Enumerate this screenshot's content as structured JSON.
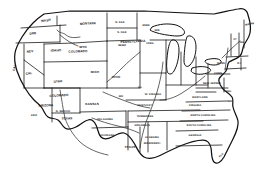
{
  "figure": {
    "name": "united-states-outline-map",
    "background_color": "#ffffff",
    "ink_color": "#111111",
    "width": 267,
    "height": 175
  },
  "states": [
    {
      "label": "WASH",
      "x": 46,
      "y": 21,
      "size": "sz-s",
      "rotate": -8
    },
    {
      "label": "ORE",
      "x": 33,
      "y": 34,
      "size": "sz-s",
      "rotate": -6
    },
    {
      "label": "MONTANA",
      "x": 88,
      "y": 24,
      "size": "sz-s",
      "rotate": -3
    },
    {
      "label": "N. DAK",
      "x": 120,
      "y": 23,
      "size": "sz-xs",
      "rotate": 0
    },
    {
      "label": "S. DAK",
      "x": 122,
      "y": 33,
      "size": "sz-xs",
      "rotate": 0
    },
    {
      "label": "MINN",
      "x": 146,
      "y": 26,
      "size": "sz-xs",
      "rotate": 0
    },
    {
      "label": "NEV",
      "x": 30,
      "y": 52,
      "size": "sz-s",
      "rotate": -4
    },
    {
      "label": "IDAHO",
      "x": 56,
      "y": 51,
      "size": "sz-s",
      "rotate": -2
    },
    {
      "label": "WYO",
      "x": 83,
      "y": 48,
      "size": "sz-s",
      "rotate": 0
    },
    {
      "label": "NEBR",
      "x": 122,
      "y": 46,
      "size": "sz-xs",
      "rotate": 0
    },
    {
      "label": "IOWA",
      "x": 150,
      "y": 44,
      "size": "sz-xs",
      "rotate": 0
    },
    {
      "label": "WIS",
      "x": 157,
      "y": 31,
      "size": "sz-xs",
      "rotate": 0
    },
    {
      "label": "CAL",
      "x": 15,
      "y": 68,
      "size": "sz-s",
      "rotate": -72
    },
    {
      "label": "CAL",
      "x": 29,
      "y": 74,
      "size": "sz-s",
      "rotate": -5
    },
    {
      "label": "UTAH",
      "x": 58,
      "y": 82,
      "size": "sz-s",
      "rotate": -4
    },
    {
      "label": "COLORADO",
      "x": 78,
      "y": 52,
      "size": "sz-s",
      "rotate": -2
    },
    {
      "label": "COLORADO",
      "x": 59,
      "y": 96,
      "size": "sz-s",
      "rotate": -3
    },
    {
      "label": "KANSAS",
      "x": 92,
      "y": 105,
      "size": "sz-s",
      "rotate": 0
    },
    {
      "label": "MO",
      "x": 121,
      "y": 97,
      "size": "sz-xs",
      "rotate": 0
    },
    {
      "label": "ILL",
      "x": 140,
      "y": 88,
      "size": "sz-xs",
      "rotate": 0
    },
    {
      "label": "MICH",
      "x": 95,
      "y": 73,
      "size": "sz-s",
      "rotate": 0
    },
    {
      "label": "OHIO",
      "x": 116,
      "y": 78,
      "size": "sz-s",
      "rotate": 0
    },
    {
      "label": "PENNSYLVANIA",
      "x": 133,
      "y": 42,
      "size": "sz-s",
      "rotate": -3
    },
    {
      "label": "ARIZONA",
      "x": 46,
      "y": 106,
      "size": "sz-s",
      "rotate": -2
    },
    {
      "label": "ARIZ",
      "x": 34,
      "y": 116,
      "size": "sz-xs",
      "rotate": 0
    },
    {
      "label": "N. MEXICO",
      "x": 63,
      "y": 112,
      "size": "sz-xs",
      "rotate": 0
    },
    {
      "label": "TEXAS",
      "x": 67,
      "y": 119,
      "size": "sz-s",
      "rotate": -2
    },
    {
      "label": "OKLAHOMA",
      "x": 105,
      "y": 120,
      "size": "sz-xs",
      "rotate": 0
    },
    {
      "label": "LOUISIANA",
      "x": 107,
      "y": 136,
      "size": "sz-xs",
      "rotate": 0
    },
    {
      "label": "TEXAS",
      "x": 130,
      "y": 148,
      "size": "sz-s",
      "rotate": 0
    },
    {
      "label": "ARKANSAS",
      "x": 142,
      "y": 126,
      "size": "sz-xs",
      "rotate": 0
    },
    {
      "label": "TENNESSEE",
      "x": 145,
      "y": 117,
      "size": "sz-xs",
      "rotate": 0
    },
    {
      "label": "KENTUCKY",
      "x": 145,
      "y": 106,
      "size": "sz-xs",
      "rotate": 0
    },
    {
      "label": "W. VIRGINIA",
      "x": 153,
      "y": 95,
      "size": "sz-xs",
      "rotate": 0
    },
    {
      "label": "ALABAMA",
      "x": 152,
      "y": 138,
      "size": "sz-xs",
      "rotate": 0
    },
    {
      "label": "MISSISSIPPI",
      "x": 152,
      "y": 144,
      "size": "sz-xs",
      "rotate": 0
    },
    {
      "label": "VIRGINIA",
      "x": 195,
      "y": 106,
      "size": "sz-xs",
      "rotate": 0
    },
    {
      "label": "MARYLAND",
      "x": 200,
      "y": 98,
      "size": "sz-xs",
      "rotate": 0
    },
    {
      "label": "NORTH CAROLINA",
      "x": 203,
      "y": 116,
      "size": "sz-xs",
      "rotate": 0
    },
    {
      "label": "SOUTH CAROLINA",
      "x": 199,
      "y": 126,
      "size": "sz-xs",
      "rotate": 0
    },
    {
      "label": "GEORGIA",
      "x": 195,
      "y": 136,
      "size": "sz-xs",
      "rotate": 0
    },
    {
      "label": "FLA",
      "x": 222,
      "y": 156,
      "size": "sz-xs",
      "rotate": -42
    },
    {
      "label": "NEW JERSEY",
      "x": 212,
      "y": 84,
      "size": "sz-xs",
      "rotate": 0
    },
    {
      "label": "DEL",
      "x": 229,
      "y": 92,
      "size": "sz-xs",
      "rotate": 0
    },
    {
      "label": "MD",
      "x": 230,
      "y": 102,
      "size": "sz-xs",
      "rotate": 0
    },
    {
      "label": "CONN",
      "x": 218,
      "y": 74,
      "size": "sz-xs",
      "rotate": 0
    },
    {
      "label": "MASS",
      "x": 221,
      "y": 64,
      "size": "sz-xs",
      "rotate": 0
    },
    {
      "label": "R.I",
      "x": 239,
      "y": 64,
      "size": "sz-xs",
      "rotate": 0
    },
    {
      "label": "VT",
      "x": 235,
      "y": 40,
      "size": "sz-xs",
      "rotate": 0
    },
    {
      "label": "NH",
      "x": 242,
      "y": 43,
      "size": "sz-xs",
      "rotate": 0
    },
    {
      "label": "MAINE",
      "x": 250,
      "y": 25,
      "size": "sz-xs",
      "rotate": -12
    }
  ]
}
